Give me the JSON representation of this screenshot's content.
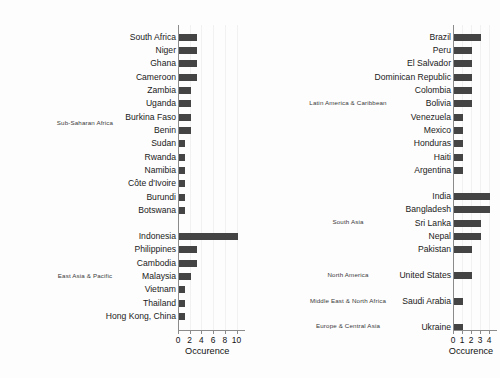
{
  "figure": {
    "background": "#fdfdfd",
    "bar_color": "#444444",
    "axis_color": "#8b8b8b",
    "grid_color": "#f1f1f1"
  },
  "chart_data": [
    {
      "type": "bar",
      "orientation": "horizontal",
      "panel": "left",
      "title": "",
      "xlabel": "Occurence",
      "ylabel": "",
      "xlim": [
        0,
        11
      ],
      "xticks": [
        0,
        2,
        4,
        6,
        8,
        10
      ],
      "xticklabels": [
        "0",
        "2",
        "4",
        "6",
        "8",
        "10"
      ],
      "grid": true,
      "legend": "none",
      "groups": [
        {
          "label": "Sub-Saharan Africa",
          "categories": [
            "South Africa",
            "Niger",
            "Ghana",
            "Cameroon",
            "Zambia",
            "Uganda",
            "Burkina Faso",
            "Benin",
            "Sudan",
            "Rwanda",
            "Namibia",
            "Côte d'Ivoire",
            "Burundi",
            "Botswana"
          ],
          "values": [
            3,
            3,
            3,
            3,
            2,
            2,
            2,
            2,
            1,
            1,
            1,
            1,
            1,
            1
          ]
        },
        {
          "label": "East Asia & Pacific",
          "categories": [
            "Indonesia",
            "Philippines",
            "Cambodia",
            "Malaysia",
            "Vietnam",
            "Thailand",
            "Hong Kong, China"
          ],
          "values": [
            10,
            3,
            3,
            2,
            1,
            1,
            1
          ]
        }
      ]
    },
    {
      "type": "bar",
      "orientation": "horizontal",
      "panel": "right",
      "title": "",
      "xlabel": "Occurence",
      "ylabel": "",
      "xlim": [
        0,
        4.6
      ],
      "xticks": [
        0,
        1,
        2,
        3,
        4
      ],
      "xticklabels": [
        "0",
        "1",
        "2",
        "3",
        "4"
      ],
      "grid": true,
      "legend": "none",
      "groups": [
        {
          "label": "Latin America & Caribbean",
          "categories": [
            "Brazil",
            "Peru",
            "El Salvador",
            "Dominican Republic",
            "Colombia",
            "Bolivia",
            "Venezuela",
            "Mexico",
            "Honduras",
            "Haiti",
            "Argentina"
          ],
          "values": [
            3,
            2,
            2,
            2,
            2,
            2,
            1,
            1,
            1,
            1,
            1
          ]
        },
        {
          "label": "South Asia",
          "categories": [
            "India",
            "Bangladesh",
            "Sri Lanka",
            "Nepal",
            "Pakistan"
          ],
          "values": [
            4,
            4,
            3,
            3,
            2
          ]
        },
        {
          "label": "North America",
          "categories": [
            "United States"
          ],
          "values": [
            2
          ]
        },
        {
          "label": "Middle East & North Africa",
          "categories": [
            "Saudi Arabia"
          ],
          "values": [
            1
          ]
        },
        {
          "label": "Europe & Central Asia",
          "categories": [
            "Ukraine"
          ],
          "values": [
            1
          ]
        }
      ]
    }
  ]
}
